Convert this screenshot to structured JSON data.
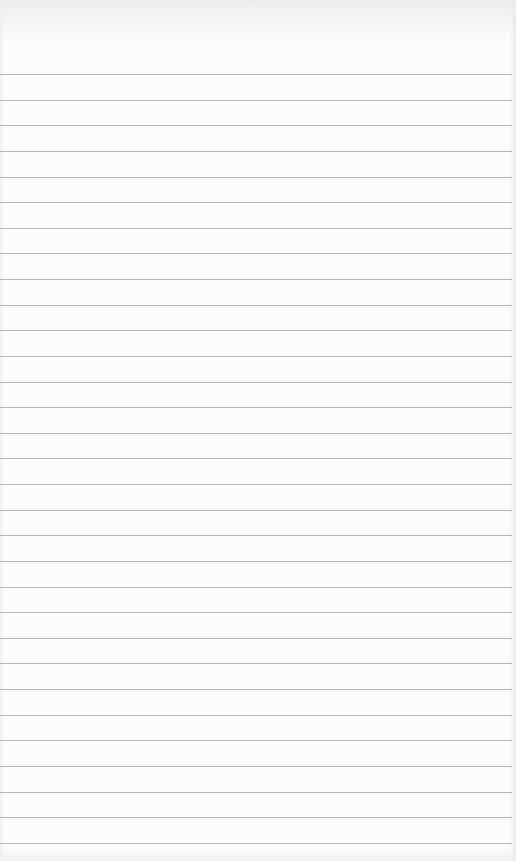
{
  "page": {
    "type": "lined-paper",
    "background_color": "#fcfcfc",
    "line_color": "#a9a9a9",
    "line_count": 31,
    "first_line_y": 74,
    "line_spacing": 25.63
  }
}
